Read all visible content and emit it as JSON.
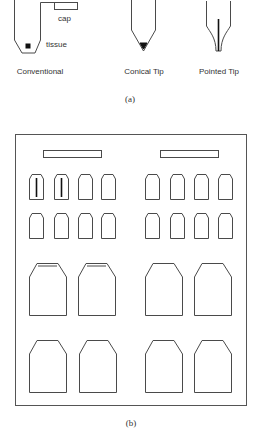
{
  "panel_a": {
    "caption": "(a)",
    "conventional": {
      "name": "Conventional",
      "cap_label": "cap",
      "tissue_label": "tissue"
    },
    "conical": {
      "name": "Conical Tip"
    },
    "pointed": {
      "name": "Pointed Tip"
    }
  },
  "panel_b": {
    "caption": "(b)",
    "bars": 2,
    "small_cavities_per_row": 8,
    "small_rows": 2,
    "large_cavities_per_row": 4,
    "large_rows": 2,
    "cavities_with_tissue": 2,
    "cavities_with_lid_line": 2
  },
  "colors": {
    "stroke": "#4a4a4a",
    "fill": "#ffffff",
    "specimen": "#111111"
  }
}
